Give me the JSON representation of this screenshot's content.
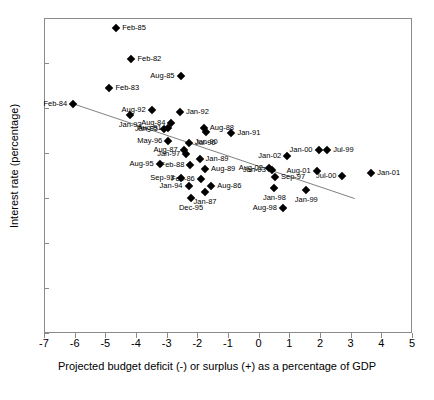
{
  "chart_data": {
    "type": "scatter",
    "title": "",
    "xlabel": "Projected budget deficit (-) or surplus (+) as a percentage of GDP",
    "ylabel": "Interest rate (percentage)",
    "xlim": [
      -7,
      5
    ],
    "ylim": [
      0,
      7
    ],
    "xticks": [
      "-7",
      "-6",
      "-5",
      "-4",
      "-3",
      "-2",
      "-1",
      "0",
      "1",
      "2",
      "3",
      "4",
      "5"
    ],
    "yticks": [
      "0",
      "1",
      "2",
      "3",
      "4",
      "5",
      "6",
      "7"
    ],
    "grid": false,
    "legend": null,
    "marker": "filled-diamond",
    "marker_color": "#000000",
    "trendline": {
      "type": "linear",
      "color": "#808080",
      "x_start": -6.1,
      "y_start": 5.12,
      "x_end": 3.1,
      "y_end": 3.01
    },
    "points": [
      {
        "label": "Feb-85",
        "x": -4.68,
        "y": 6.81,
        "lpos": "right"
      },
      {
        "label": "Feb-82",
        "x": -4.18,
        "y": 6.12,
        "lpos": "right"
      },
      {
        "label": "Aug-85",
        "x": -2.58,
        "y": 5.74,
        "lpos": "left"
      },
      {
        "label": "Feb-83",
        "x": -4.9,
        "y": 5.46,
        "lpos": "right"
      },
      {
        "label": "Feb-84",
        "x": -6.08,
        "y": 5.11,
        "lpos": "left"
      },
      {
        "label": "Aug-92",
        "x": -3.52,
        "y": 4.97,
        "lpos": "left"
      },
      {
        "label": "Jan-92",
        "x": -2.6,
        "y": 4.94,
        "lpos": "right"
      },
      {
        "label": "Jan-93",
        "x": -4.22,
        "y": 4.87,
        "lpos": "below"
      },
      {
        "label": "Aug-84",
        "x": -2.88,
        "y": 4.68,
        "lpos": "left"
      },
      {
        "label": "Aug-88",
        "x": -1.82,
        "y": 4.58,
        "lpos": "right"
      },
      {
        "label": "Aug-91",
        "x": -3.0,
        "y": 4.57,
        "lpos": "left"
      },
      {
        "label": "Jan-95",
        "x": -3.12,
        "y": 4.55,
        "lpos": "left"
      },
      {
        "label": "Jan-90",
        "x": -1.74,
        "y": 4.5,
        "lpos": "below"
      },
      {
        "label": "Jan-91",
        "x": -0.92,
        "y": 4.46,
        "lpos": "right"
      },
      {
        "label": "May-96",
        "x": -2.98,
        "y": 4.28,
        "lpos": "left"
      },
      {
        "label": "Jul-90",
        "x": -2.3,
        "y": 4.24,
        "lpos": "right"
      },
      {
        "label": "Aug-87",
        "x": -2.48,
        "y": 4.09,
        "lpos": "left"
      },
      {
        "label": "Jan-97",
        "x": -2.4,
        "y": 4.0,
        "lpos": "left"
      },
      {
        "label": "Jan-00",
        "x": 1.92,
        "y": 4.08,
        "lpos": "left"
      },
      {
        "label": "Jul-99",
        "x": 2.2,
        "y": 4.08,
        "lpos": "right"
      },
      {
        "label": "Jan-02",
        "x": 0.9,
        "y": 3.95,
        "lpos": "left"
      },
      {
        "label": "Jan-89",
        "x": -1.96,
        "y": 3.88,
        "lpos": "right"
      },
      {
        "label": "Feb-88",
        "x": -2.26,
        "y": 3.76,
        "lpos": "left"
      },
      {
        "label": "Aug-95",
        "x": -3.26,
        "y": 3.78,
        "lpos": "left"
      },
      {
        "label": "Aug-89",
        "x": -1.78,
        "y": 3.66,
        "lpos": "right"
      },
      {
        "label": "Aug-02",
        "x": 0.3,
        "y": 3.69,
        "lpos": "left"
      },
      {
        "label": "Jan-03",
        "x": 0.4,
        "y": 3.64,
        "lpos": "left"
      },
      {
        "label": "Aug-01",
        "x": 1.86,
        "y": 3.62,
        "lpos": "left"
      },
      {
        "label": "Jan-01",
        "x": 3.64,
        "y": 3.58,
        "lpos": "right"
      },
      {
        "label": "Sep-97",
        "x": 0.5,
        "y": 3.48,
        "lpos": "right"
      },
      {
        "label": "Sep-93",
        "x": -2.58,
        "y": 3.47,
        "lpos": "left"
      },
      {
        "label": "Feb-86",
        "x": -1.92,
        "y": 3.44,
        "lpos": "left"
      },
      {
        "label": "Jul-00",
        "x": 2.7,
        "y": 3.52,
        "lpos": "left"
      },
      {
        "label": "Jan-94",
        "x": -2.32,
        "y": 3.3,
        "lpos": "left"
      },
      {
        "label": "Aug-86",
        "x": -1.58,
        "y": 3.3,
        "lpos": "right"
      },
      {
        "label": "Jan-87",
        "x": -1.78,
        "y": 3.16,
        "lpos": "below"
      },
      {
        "label": "Jan-98",
        "x": 0.48,
        "y": 3.25,
        "lpos": "below"
      },
      {
        "label": "Jan-99",
        "x": 1.52,
        "y": 3.2,
        "lpos": "below"
      },
      {
        "label": "Dec-95",
        "x": -2.24,
        "y": 3.02,
        "lpos": "below"
      },
      {
        "label": "Aug-98",
        "x": 0.76,
        "y": 2.8,
        "lpos": "left"
      }
    ]
  }
}
